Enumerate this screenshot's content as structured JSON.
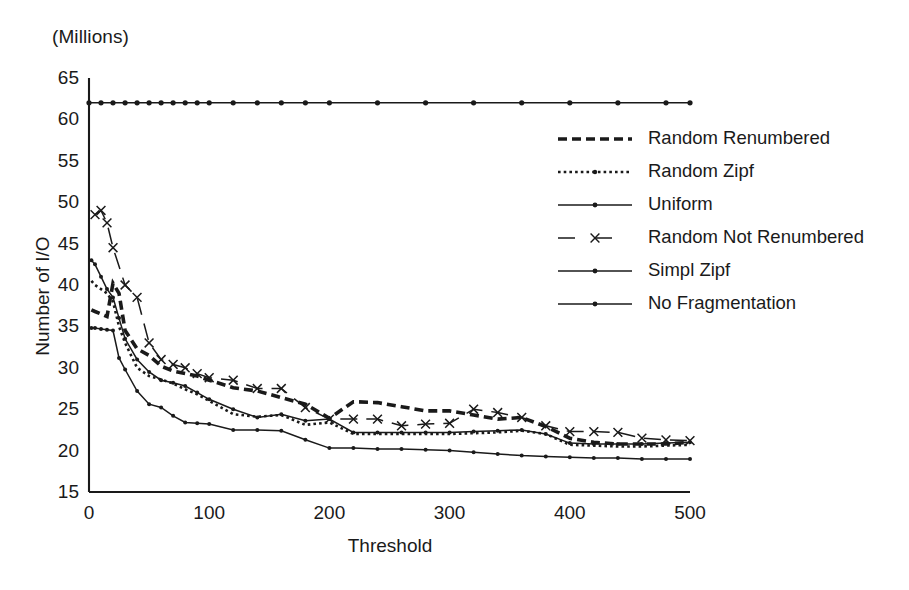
{
  "unit_note": "(Millions)",
  "axes": {
    "xlabel": "Threshold",
    "ylabel": "Number of I/O",
    "xticks": [
      "0",
      "100",
      "200",
      "300",
      "400",
      "500"
    ],
    "yticks": [
      "65",
      "60",
      "55",
      "50",
      "45",
      "40",
      "35",
      "30",
      "25",
      "20",
      "15"
    ]
  },
  "legend": {
    "items": [
      {
        "label": "Random Renumbered",
        "key": "thick-dashed-line"
      },
      {
        "label": "Random Zipf",
        "key": "fine-dotted-line"
      },
      {
        "label": "Uniform",
        "key": "solid-line-with-dot"
      },
      {
        "label": "Random Not Renumbered",
        "key": "long-dashed-line-with-x"
      },
      {
        "label": "Simpl Zipf",
        "key": "solid-line-with-dot"
      },
      {
        "label": "No Fragmentation",
        "key": "solid-line-with-dot"
      }
    ]
  },
  "chart_data": {
    "type": "line",
    "title": "",
    "subtitle": "(Millions)",
    "xlabel": "Threshold",
    "ylabel": "Number of I/O",
    "xlim": [
      0,
      500
    ],
    "ylim": [
      15,
      65
    ],
    "xticks": [
      0,
      100,
      200,
      300,
      400,
      500
    ],
    "yticks": [
      15,
      20,
      25,
      30,
      35,
      40,
      45,
      50,
      55,
      60,
      65
    ],
    "grid": false,
    "legend_position": "right",
    "units": "Millions of I/O",
    "series": [
      {
        "name": "Random Renumbered",
        "style": "thick-dashed",
        "x": [
          2,
          5,
          10,
          15,
          20,
          25,
          30,
          40,
          50,
          60,
          70,
          80,
          90,
          100,
          120,
          140,
          160,
          180,
          200,
          220,
          240,
          260,
          280,
          300,
          320,
          340,
          360,
          380,
          400,
          420,
          440,
          460,
          480,
          500
        ],
        "y": [
          37.0,
          36.8,
          36.5,
          36.2,
          40.2,
          39.0,
          34.5,
          32.3,
          31.5,
          30.2,
          29.6,
          29.3,
          29.0,
          28.5,
          27.6,
          27.2,
          26.4,
          25.6,
          23.9,
          25.9,
          25.8,
          25.3,
          24.8,
          24.8,
          24.3,
          23.8,
          24.0,
          22.9,
          21.5,
          21.0,
          20.8,
          20.8,
          20.8,
          21.0
        ]
      },
      {
        "name": "Random Zipf",
        "style": "fine-dotted",
        "x": [
          2,
          5,
          10,
          15,
          20,
          25,
          30,
          40,
          50,
          60,
          70,
          80,
          90,
          100,
          120,
          140,
          160,
          180,
          200,
          220,
          240,
          260,
          280,
          300,
          320,
          340,
          360,
          380,
          400,
          420,
          440,
          460,
          480,
          500
        ],
        "y": [
          40.5,
          40.0,
          39.5,
          39.0,
          38.0,
          35.0,
          33.0,
          30.0,
          29.0,
          28.6,
          28.1,
          27.4,
          26.8,
          26.0,
          24.4,
          24.1,
          24.3,
          23.1,
          23.4,
          22.0,
          22.0,
          22.0,
          22.0,
          22.0,
          22.1,
          22.2,
          22.4,
          22.0,
          20.7,
          20.6,
          20.5,
          20.5,
          20.6,
          20.7
        ]
      },
      {
        "name": "Uniform",
        "style": "solid-thin",
        "x": [
          2,
          5,
          10,
          15,
          20,
          25,
          30,
          40,
          50,
          60,
          70,
          80,
          90,
          100,
          120,
          140,
          160,
          180,
          200,
          220,
          240,
          260,
          280,
          300,
          320,
          340,
          360,
          380,
          400,
          420,
          440,
          460,
          480,
          500
        ],
        "y": [
          34.8,
          34.8,
          34.7,
          34.6,
          34.5,
          31.2,
          29.8,
          27.2,
          25.6,
          25.2,
          24.2,
          23.4,
          23.3,
          23.2,
          22.5,
          22.5,
          22.4,
          21.3,
          20.3,
          20.3,
          20.2,
          20.2,
          20.1,
          20.0,
          19.8,
          19.6,
          19.4,
          19.3,
          19.2,
          19.1,
          19.1,
          19.0,
          19.0,
          19.0
        ]
      },
      {
        "name": "Random Not Renumbered",
        "style": "long-dashed-x",
        "x": [
          5,
          10,
          15,
          20,
          30,
          40,
          50,
          60,
          70,
          80,
          90,
          100,
          120,
          140,
          160,
          180,
          200,
          220,
          240,
          260,
          280,
          300,
          320,
          340,
          360,
          380,
          400,
          420,
          440,
          460,
          480,
          500
        ],
        "y": [
          48.5,
          49.0,
          47.5,
          44.5,
          40.0,
          38.5,
          33.0,
          31.0,
          30.4,
          30.0,
          29.3,
          28.8,
          28.5,
          27.5,
          27.5,
          25.2,
          23.8,
          23.8,
          23.8,
          23.0,
          23.2,
          23.3,
          25.0,
          24.6,
          24.0,
          23.0,
          22.3,
          22.3,
          22.2,
          21.5,
          21.3,
          21.2
        ]
      },
      {
        "name": "Simpl Zipf",
        "style": "solid-thin-dot",
        "x": [
          2,
          5,
          10,
          15,
          20,
          25,
          30,
          40,
          50,
          60,
          70,
          80,
          90,
          100,
          120,
          140,
          160,
          180,
          200,
          220,
          240,
          260,
          280,
          300,
          320,
          340,
          360,
          380,
          400,
          420,
          440,
          460,
          480,
          500
        ],
        "y": [
          43.0,
          42.5,
          41.0,
          39.5,
          38.5,
          36.0,
          33.5,
          31.0,
          29.5,
          28.5,
          28.2,
          27.8,
          27.0,
          26.2,
          25.0,
          24.0,
          24.4,
          23.6,
          23.8,
          22.2,
          22.2,
          22.2,
          22.2,
          22.2,
          22.3,
          22.4,
          22.5,
          22.0,
          20.9,
          20.8,
          20.8,
          20.8,
          20.9,
          21.0
        ]
      },
      {
        "name": "No Fragmentation",
        "style": "solid-dotted-flat",
        "x": [
          0,
          10,
          20,
          30,
          40,
          50,
          60,
          70,
          80,
          90,
          100,
          120,
          140,
          160,
          180,
          200,
          240,
          280,
          320,
          360,
          400,
          440,
          480,
          500
        ],
        "y": [
          62.0,
          62.0,
          62.0,
          62.0,
          62.0,
          62.0,
          62.0,
          62.0,
          62.0,
          62.0,
          62.0,
          62.0,
          62.0,
          62.0,
          62.0,
          62.0,
          62.0,
          62.0,
          62.0,
          62.0,
          62.0,
          62.0,
          62.0,
          62.0
        ]
      }
    ]
  }
}
